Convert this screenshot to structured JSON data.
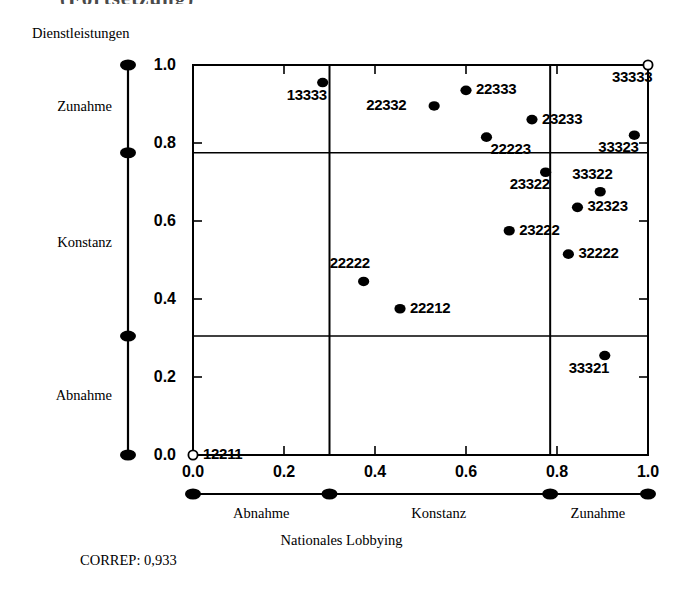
{
  "figure": {
    "title_remnant": "(Fortsetzung)",
    "y_axis_title": "Dienstleistungen",
    "x_axis_title": "Nationales Lobbying",
    "footer_note": "CORREP: 0,933"
  },
  "chart_data": {
    "type": "scatter",
    "title": "",
    "xlabel": "Nationales Lobbying",
    "ylabel": "Dienstleistungen",
    "xlim": [
      0.0,
      1.0
    ],
    "ylim": [
      0.0,
      1.0
    ],
    "grid": false,
    "x_tick_labels": [
      "0.0",
      "0.2",
      "0.4",
      "0.6",
      "0.8",
      "1.0"
    ],
    "x_tick_values": [
      0.0,
      0.2,
      0.4,
      0.6,
      0.8,
      1.0
    ],
    "y_tick_labels": [
      "0.0",
      "0.2",
      "0.4",
      "0.6",
      "0.8",
      "1.0"
    ],
    "y_tick_values": [
      0.0,
      0.2,
      0.4,
      0.6,
      0.8,
      1.0
    ],
    "x_category_scale": {
      "label": "Nationales Lobbying",
      "node_values": [
        0.0,
        0.3,
        0.785,
        1.0
      ],
      "categories": [
        {
          "label": "Abnahme",
          "position": 0.15
        },
        {
          "label": "Konstanz",
          "position": 0.54
        },
        {
          "label": "Zunahme",
          "position": 0.89
        }
      ]
    },
    "y_category_scale": {
      "label": "Dienstleistungen",
      "node_values": [
        0.0,
        0.305,
        0.775,
        1.0
      ],
      "categories": [
        {
          "label": "Zunahme",
          "position": 0.89
        },
        {
          "label": "Konstanz",
          "position": 0.54
        },
        {
          "label": "Abnahme",
          "position": 0.15
        }
      ]
    },
    "reference_lines": {
      "vertical": [
        0.3,
        0.785
      ],
      "horizontal": [
        0.305,
        0.775
      ]
    },
    "points": [
      {
        "label": "12211",
        "x": 0.0,
        "y": 0.0,
        "marker": "open",
        "label_pos": "right"
      },
      {
        "label": "13333",
        "x": 0.285,
        "y": 0.955,
        "marker": "filled",
        "label_pos": "below-left"
      },
      {
        "label": "22222",
        "x": 0.375,
        "y": 0.445,
        "marker": "filled",
        "label_pos": "above-left"
      },
      {
        "label": "22212",
        "x": 0.455,
        "y": 0.375,
        "marker": "filled",
        "label_pos": "right"
      },
      {
        "label": "22332",
        "x": 0.53,
        "y": 0.895,
        "marker": "filled",
        "label_pos": "left"
      },
      {
        "label": "22333",
        "x": 0.6,
        "y": 0.935,
        "marker": "filled",
        "label_pos": "right"
      },
      {
        "label": "22223",
        "x": 0.645,
        "y": 0.815,
        "marker": "filled",
        "label_pos": "below-right"
      },
      {
        "label": "23222",
        "x": 0.695,
        "y": 0.575,
        "marker": "filled",
        "label_pos": "right"
      },
      {
        "label": "23233",
        "x": 0.745,
        "y": 0.86,
        "marker": "filled",
        "label_pos": "right"
      },
      {
        "label": "23322",
        "x": 0.775,
        "y": 0.725,
        "marker": "filled",
        "label_pos": "below-left"
      },
      {
        "label": "32222",
        "x": 0.825,
        "y": 0.515,
        "marker": "filled",
        "label_pos": "right"
      },
      {
        "label": "32323",
        "x": 0.845,
        "y": 0.635,
        "marker": "filled",
        "label_pos": "right"
      },
      {
        "label": "33322",
        "x": 0.895,
        "y": 0.675,
        "marker": "filled",
        "label_pos": "above"
      },
      {
        "label": "33321",
        "x": 0.905,
        "y": 0.255,
        "marker": "filled",
        "label_pos": "below-left"
      },
      {
        "label": "33323",
        "x": 0.97,
        "y": 0.82,
        "marker": "filled",
        "label_pos": "below-left"
      },
      {
        "label": "33333",
        "x": 1.0,
        "y": 1.0,
        "marker": "open",
        "label_pos": "below-left"
      }
    ]
  }
}
